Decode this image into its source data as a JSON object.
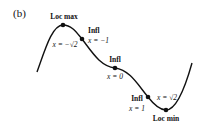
{
  "panel_label": "(b)",
  "curve": {
    "description": "Graph of a polynomial with a local maximum, three inflection points, and a local minimum",
    "color": "#111111"
  },
  "points": [
    {
      "id": "loc-max",
      "title": "Loc max",
      "coord": "x = −√2"
    },
    {
      "id": "infl-neg1",
      "title": "Infl",
      "coord": "x = −1"
    },
    {
      "id": "infl-0",
      "title": "Infl",
      "coord": "x = 0"
    },
    {
      "id": "infl-1",
      "title": "Infl",
      "coord": "x = 1"
    },
    {
      "id": "loc-min",
      "title": "Loc min",
      "coord": "x = √2"
    }
  ]
}
